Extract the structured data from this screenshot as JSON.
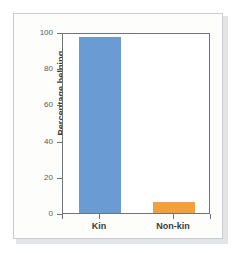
{
  "chart_data": {
    "type": "bar",
    "title": "",
    "subtitle": "",
    "xlabel": "",
    "ylabel": "Percentage helping",
    "categories": [
      "Kin",
      "Non-kin"
    ],
    "values": [
      97,
      6
    ],
    "series": [
      {
        "name": "Percentage helping",
        "values": [
          97,
          6
        ],
        "colors": [
          "#6a9bd2",
          "#f2a03c"
        ]
      }
    ],
    "ylim": [
      0,
      100
    ],
    "yticks": [
      0,
      20,
      40,
      60,
      80,
      100
    ],
    "ytick_labels": [
      "0",
      "20",
      "40",
      "60",
      "80",
      "100"
    ],
    "grid": false,
    "legend": false,
    "legend_position": "none",
    "bar_colors": {
      "kin": "#6a9bd2",
      "non_kin": "#f2a03c"
    }
  },
  "figure": {
    "background": "#ffffff",
    "panel_background": "#fdfdfb",
    "frame_color": "#c9ccd0",
    "axis_color": "#6f7478",
    "tick_text_color": "#58595b",
    "label_text_color": "#3b3b3b"
  }
}
